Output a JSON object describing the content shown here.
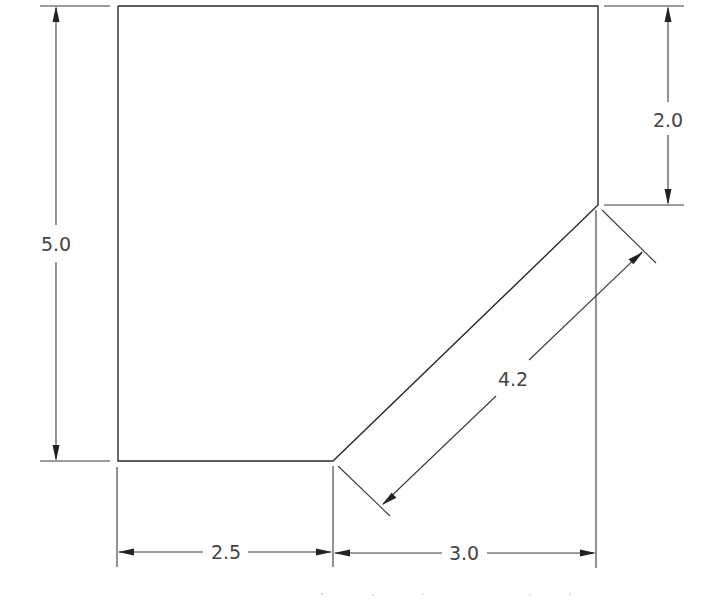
{
  "drawing": {
    "type": "technical-dimension-drawing",
    "colors": {
      "line": "#2a2a2a",
      "text": "#444444",
      "background": "#ffffff"
    },
    "dimensions": {
      "left_height": "5.0",
      "right_height": "2.0",
      "bottom_left_width": "2.5",
      "bottom_right_width": "3.0",
      "diagonal_length": "4.2"
    }
  }
}
